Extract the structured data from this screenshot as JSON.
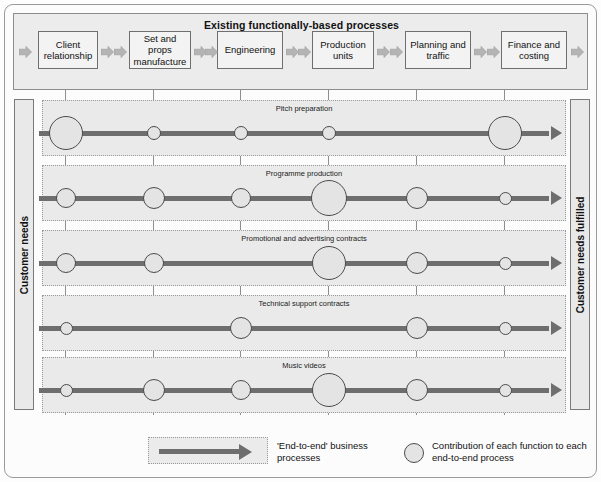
{
  "figure": {
    "top_band_title": "Existing functionally-based processes",
    "left_axis_label": "Customer needs",
    "right_axis_label": "Customer needs fulfilled"
  },
  "functions": [
    {
      "label": "Client relationship",
      "box_x": 38,
      "box_w": 60,
      "line_x": 65
    },
    {
      "label": "Set and props manufacture",
      "box_x": 129,
      "box_w": 62,
      "line_x": 153
    },
    {
      "label": "Engineering",
      "box_x": 217,
      "box_w": 66,
      "line_x": 240
    },
    {
      "label": "Production units",
      "box_x": 312,
      "box_w": 62,
      "line_x": 328
    },
    {
      "label": "Planning and traffic",
      "box_x": 405,
      "box_w": 66,
      "line_x": 416
    },
    {
      "label": "Finance and costing",
      "box_x": 501,
      "box_w": 66,
      "line_x": 504
    }
  ],
  "processes": [
    {
      "label": "Pitch preparation",
      "top": 100,
      "height": 56,
      "contributions": [
        {
          "function": "Client relationship",
          "size": 34
        },
        {
          "function": "Set and props manufacture",
          "size": 14
        },
        {
          "function": "Engineering",
          "size": 14
        },
        {
          "function": "Production units",
          "size": 14
        },
        {
          "function": "Planning and traffic",
          "size": 0
        },
        {
          "function": "Finance and costing",
          "size": 34
        }
      ]
    },
    {
      "label": "Programme production",
      "top": 165,
      "height": 56,
      "contributions": [
        {
          "function": "Client relationship",
          "size": 20
        },
        {
          "function": "Set and props manufacture",
          "size": 22
        },
        {
          "function": "Engineering",
          "size": 20
        },
        {
          "function": "Production units",
          "size": 36
        },
        {
          "function": "Planning and traffic",
          "size": 22
        },
        {
          "function": "Finance and costing",
          "size": 13
        }
      ]
    },
    {
      "label": "Promotional and advertising contracts",
      "top": 230,
      "height": 56,
      "contributions": [
        {
          "function": "Client relationship",
          "size": 20
        },
        {
          "function": "Set and props manufacture",
          "size": 20
        },
        {
          "function": "Engineering",
          "size": 0
        },
        {
          "function": "Production units",
          "size": 34
        },
        {
          "function": "Planning and traffic",
          "size": 22
        },
        {
          "function": "Finance and costing",
          "size": 13
        }
      ]
    },
    {
      "label": "Technical support contracts",
      "top": 295,
      "height": 56,
      "contributions": [
        {
          "function": "Client relationship",
          "size": 13
        },
        {
          "function": "Set and props manufacture",
          "size": 0
        },
        {
          "function": "Engineering",
          "size": 22
        },
        {
          "function": "Production units",
          "size": 0
        },
        {
          "function": "Planning and traffic",
          "size": 22
        },
        {
          "function": "Finance and costing",
          "size": 13
        }
      ]
    },
    {
      "label": "Music videos",
      "top": 357,
      "height": 56,
      "contributions": [
        {
          "function": "Client relationship",
          "size": 13
        },
        {
          "function": "Set and props manufacture",
          "size": 22
        },
        {
          "function": "Engineering",
          "size": 20
        },
        {
          "function": "Production units",
          "size": 34
        },
        {
          "function": "Planning and traffic",
          "size": 22
        },
        {
          "function": "Finance and costing",
          "size": 13
        }
      ]
    }
  ],
  "legend": {
    "arrow_label": "'End-to-end' business processes",
    "circle_label": "Contribution of each function to each end-to-end process"
  },
  "colors": {
    "band_fill": "#ececec",
    "row_fill": "#eaeaea",
    "node_fill": "#e4e4e4",
    "arrow_gray": "#6e6e6e",
    "border_gray": "#8d8d8d"
  }
}
